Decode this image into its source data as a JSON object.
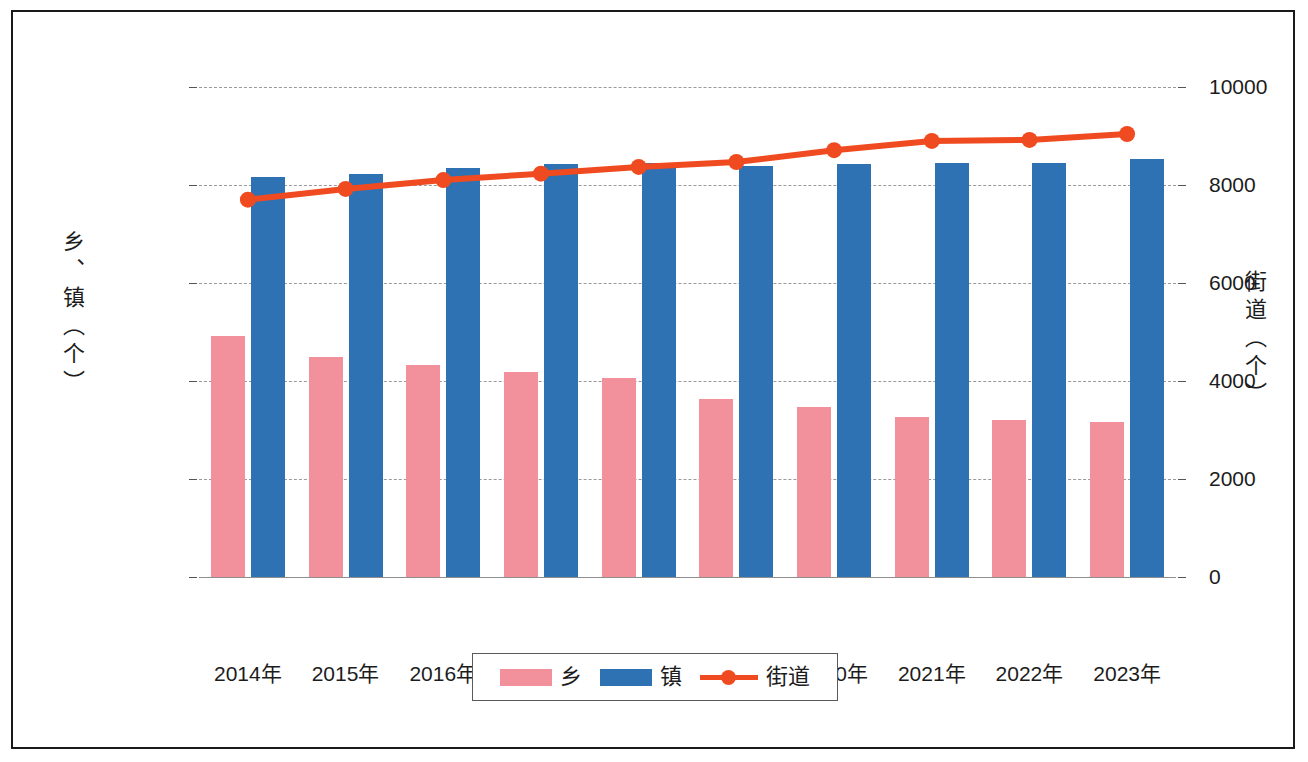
{
  "chart_data": {
    "type": "bar",
    "title": "",
    "subtitle": "",
    "xlabel": "",
    "ylabel": "乡、镇（个）",
    "ylabel_secondary": "街道（个）",
    "categories": [
      "2014年",
      "2015年",
      "2016年",
      "2017年",
      "2018年",
      "2019年",
      "2020年",
      "2021年",
      "2022年",
      "2023年"
    ],
    "ylim": [
      0,
      25000
    ],
    "yticks": [
      "0",
      "5000",
      "10000",
      "15000",
      "20000",
      "25000"
    ],
    "ytick_values": [
      0,
      5000,
      10000,
      15000,
      20000,
      25000
    ],
    "ylim_secondary": [
      0,
      10000
    ],
    "yticks_secondary": [
      "0",
      "2000",
      "4000",
      "6000",
      "8000",
      "10000"
    ],
    "ytick_values_secondary": [
      0,
      2000,
      4000,
      6000,
      8000,
      10000
    ],
    "grid": true,
    "legend_position": "bottom",
    "series": [
      {
        "name": "乡",
        "type": "bar",
        "axis": "left",
        "color": "#F2909C",
        "values": [
          12300,
          11250,
          10800,
          10450,
          10150,
          9100,
          8650,
          8150,
          8000,
          7900
        ]
      },
      {
        "name": "镇",
        "type": "bar",
        "axis": "left",
        "color": "#2E72B3",
        "values": [
          20400,
          20550,
          20850,
          21050,
          21100,
          20950,
          21050,
          21100,
          21100,
          21350
        ]
      },
      {
        "name": "街道",
        "type": "line",
        "axis": "right",
        "color": "#F04B20",
        "values": [
          7700,
          7920,
          8100,
          8230,
          8370,
          8470,
          8710,
          8900,
          8920,
          9040
        ]
      }
    ]
  },
  "legend": {
    "items": [
      {
        "label": "乡",
        "marker": "pink-square-swatch"
      },
      {
        "label": "镇",
        "marker": "blue-square-swatch"
      },
      {
        "label": "街道",
        "marker": "red-line-dot-marker"
      }
    ]
  },
  "colors": {
    "xiang": "#F2909C",
    "zhen": "#2E72B3",
    "jiedao": "#F04B20",
    "grid": "#9a9a9a",
    "text": "#1c1c1c",
    "frame": "#1a1a1a",
    "background": "#ffffff"
  }
}
